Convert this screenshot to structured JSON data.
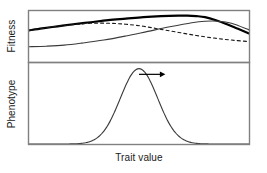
{
  "figure": {
    "width": 267,
    "height": 173,
    "background": "#ffffff"
  },
  "axes": {
    "x_label": "Trait value",
    "y_label_top": "Fitness",
    "y_label_bottom": "Phenotype",
    "frame_color": "#808080",
    "text_color": "#1a1a1a"
  },
  "chart_data": {
    "type": "line",
    "title": "",
    "subtitle": "",
    "xlabel": "Trait value",
    "ylabel": "Fitness / Phenotype",
    "grid": false,
    "legend": "none",
    "annotations": [
      {
        "name": "directional-selection-arrow",
        "kind": "arrow",
        "description": "horizontal arrow pointing right from the phenotype distribution peak",
        "x_start": 0.5,
        "x_end": 0.62,
        "y": 0.86,
        "color": "#000000"
      }
    ],
    "panels": [
      {
        "name": "fitness-panel",
        "ylabel": "Fitness",
        "xlim": [
          0,
          1
        ],
        "ylim": [
          0,
          1
        ],
        "series": [
          {
            "name": "total-fitness",
            "style": "solid-bold",
            "color": "#000000",
            "width": 2.2,
            "x": [
              0.0,
              0.06,
              0.13,
              0.2,
              0.28,
              0.36,
              0.44,
              0.52,
              0.6,
              0.68,
              0.72,
              0.76,
              0.8,
              0.85,
              0.9,
              0.95,
              1.0
            ],
            "y": [
              0.62,
              0.66,
              0.7,
              0.74,
              0.78,
              0.82,
              0.85,
              0.88,
              0.9,
              0.91,
              0.91,
              0.9,
              0.88,
              0.82,
              0.74,
              0.65,
              0.56
            ]
          },
          {
            "name": "fitness-component-dashed",
            "style": "dashed",
            "color": "#1a1a1a",
            "width": 1.1,
            "dash": "3,3",
            "x": [
              0.0,
              0.06,
              0.13,
              0.2,
              0.28,
              0.36,
              0.44,
              0.52,
              0.6,
              0.68,
              0.76,
              0.84,
              0.92,
              1.0
            ],
            "y": [
              0.62,
              0.66,
              0.7,
              0.73,
              0.76,
              0.76,
              0.74,
              0.7,
              0.64,
              0.58,
              0.52,
              0.47,
              0.43,
              0.4
            ]
          },
          {
            "name": "fitness-component-solid-thin",
            "style": "solid-thin",
            "color": "#3a3a3a",
            "width": 1.1,
            "x": [
              0.0,
              0.08,
              0.16,
              0.24,
              0.34,
              0.44,
              0.54,
              0.64,
              0.74,
              0.8,
              0.86,
              0.92,
              1.0
            ],
            "y": [
              0.3,
              0.31,
              0.33,
              0.37,
              0.43,
              0.51,
              0.6,
              0.69,
              0.77,
              0.8,
              0.8,
              0.76,
              0.63
            ]
          }
        ]
      },
      {
        "name": "phenotype-panel",
        "ylabel": "Phenotype",
        "xlim": [
          0,
          1
        ],
        "ylim": [
          0,
          1
        ],
        "series": [
          {
            "name": "phenotype-distribution",
            "style": "solid-thin",
            "color": "#3a3a3a",
            "width": 1.1,
            "distribution": "gaussian",
            "mean": 0.5,
            "sigma": 0.085,
            "peak_height": 0.93
          }
        ]
      }
    ]
  }
}
